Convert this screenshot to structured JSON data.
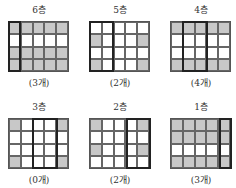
{
  "panels": [
    {
      "label": "6층",
      "caption": "(3개)",
      "shaded": [
        [
          1,
          1,
          1,
          1,
          1
        ],
        [
          0,
          0,
          0,
          0,
          0
        ],
        [
          1,
          1,
          1,
          1,
          1
        ],
        [
          1,
          1,
          1,
          1,
          1
        ]
      ],
      "outline_cols": [
        0,
        0
      ]
    },
    {
      "label": "5층",
      "caption": "(2개)",
      "shaded": [
        [
          0,
          0,
          0,
          0,
          0
        ],
        [
          1,
          0,
          0,
          0,
          1
        ],
        [
          0,
          0,
          0,
          0,
          0
        ],
        [
          1,
          0,
          0,
          0,
          1
        ]
      ],
      "outline_cols": [
        0,
        1
      ]
    },
    {
      "label": "4층",
      "caption": "(4개)",
      "shaded": [
        [
          1,
          1,
          1,
          1,
          1
        ],
        [
          0,
          0,
          0,
          0,
          0
        ],
        [
          0,
          0,
          0,
          0,
          0
        ],
        [
          1,
          1,
          1,
          1,
          1
        ]
      ],
      "outline_cols": [
        1,
        2
      ]
    },
    {
      "label": "3층",
      "caption": "(0개)",
      "shaded": [
        [
          1,
          0,
          0,
          0,
          1
        ],
        [
          0,
          0,
          0,
          0,
          0
        ],
        [
          0,
          0,
          0,
          0,
          0
        ],
        [
          1,
          0,
          0,
          0,
          1
        ]
      ],
      "outline_cols": [
        2,
        3
      ]
    },
    {
      "label": "2층",
      "caption": "(2개)",
      "shaded": [
        [
          1,
          0,
          0,
          0,
          1
        ],
        [
          0,
          0,
          0,
          0,
          0
        ],
        [
          1,
          0,
          0,
          0,
          1
        ],
        [
          0,
          0,
          0,
          0,
          0
        ]
      ],
      "outline_cols": [
        3,
        4
      ]
    },
    {
      "label": "1층",
      "caption": "(3개)",
      "shaded": [
        [
          1,
          1,
          1,
          1,
          1
        ],
        [
          1,
          1,
          1,
          1,
          1
        ],
        [
          0,
          0,
          0,
          0,
          0
        ],
        [
          1,
          1,
          1,
          1,
          1
        ]
      ],
      "outline_cols": [
        4,
        4
      ]
    }
  ],
  "colors": {
    "shaded": "#c8c8c8",
    "empty": "#ffffff",
    "outline": "#222222"
  }
}
